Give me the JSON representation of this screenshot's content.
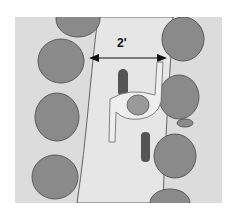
{
  "illustration": {
    "description": "Top-down view of a person walking on a path between two rows of shrubs",
    "dimension_label": "2'",
    "colors": {
      "background": "#ffffff",
      "ground": "#dcdcdc",
      "path": "#e6e6e6",
      "shrub": "#8a8a8a",
      "shrub_edge": "#5a5a5a",
      "person_shirt": "#eeeeee",
      "person_dark": "#555555"
    }
  }
}
